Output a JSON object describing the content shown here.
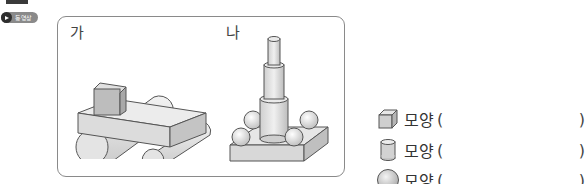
{
  "badge": {
    "label": "동영상",
    "icon": "play-icon"
  },
  "panel": {
    "figures": [
      {
        "label": "가",
        "description": "plank on two cylinders with a cube on top"
      },
      {
        "label": "나",
        "description": "stacked cylinders on a square base with four spheres"
      }
    ]
  },
  "answers": [
    {
      "shape_icon": "cube-icon",
      "word": "모양",
      "open": "(",
      "close": ")",
      "value": ""
    },
    {
      "shape_icon": "cylinder-icon",
      "word": "모양",
      "open": "(",
      "close": ")",
      "value": ""
    },
    {
      "shape_icon": "sphere-icon",
      "word": "모양",
      "open": "(",
      "close": ")",
      "value": ""
    }
  ],
  "colors": {
    "border": "#8a8a8a",
    "shape_fill": "#d9d9d9",
    "badge_bg": "#8a8a8a"
  }
}
